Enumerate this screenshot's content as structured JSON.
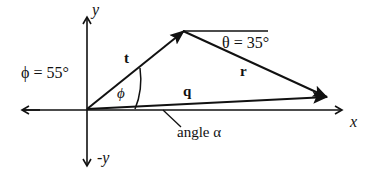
{
  "diagram": {
    "type": "vector-diagram",
    "axes": {
      "x_label": "x",
      "y_label": "y",
      "neg_y_label": "-y"
    },
    "vectors": [
      {
        "name": "t",
        "label": "t",
        "from": "origin",
        "to": "apex"
      },
      {
        "name": "r",
        "label": "r",
        "from": "apex",
        "to": "tip"
      },
      {
        "name": "q",
        "label": "q",
        "from": "origin",
        "to": "tip"
      }
    ],
    "angles": {
      "phi": {
        "symbol": "ϕ",
        "label": "ϕ = 55°",
        "value_deg": 55
      },
      "theta": {
        "symbol": "θ",
        "label": "θ = 35°",
        "value_deg": 35
      },
      "alpha": {
        "label": "angle α"
      }
    },
    "colors": {
      "ink": "#111111",
      "background": "#ffffff"
    }
  }
}
